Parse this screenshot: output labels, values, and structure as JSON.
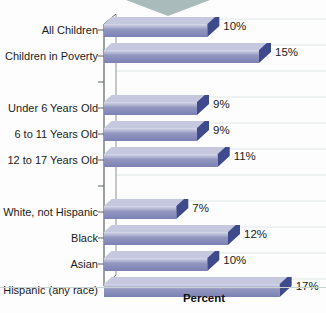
{
  "chart_data": {
    "type": "bar",
    "orientation": "horizontal",
    "title": "",
    "subtitle": "",
    "xlabel": "Percent",
    "ylabel": "",
    "xlim": [
      0,
      18
    ],
    "grid": true,
    "legend": "none",
    "value_suffix": "%",
    "categories": [
      "All Children",
      "Children in Poverty",
      "Under 6 Years Old",
      "6 to 11 Years Old",
      "12 to 17 Years Old",
      "White, not Hispanic",
      "Black",
      "Asian",
      "Hispanic (any race)"
    ],
    "values": [
      10,
      15,
      9,
      9,
      11,
      7,
      12,
      10,
      17
    ],
    "value_labels": [
      "10%",
      "15%",
      "9%",
      "9%",
      "11%",
      "7%",
      "12%",
      "10%",
      "17%"
    ],
    "rows": [
      {
        "label": "All Children",
        "value": 10,
        "value_label": "10%",
        "gap_after": false
      },
      {
        "label": "Children in Poverty",
        "value": 15,
        "value_label": "15%",
        "gap_after": true
      },
      {
        "label": "Under 6 Years Old",
        "value": 9,
        "value_label": "9%",
        "gap_after": false
      },
      {
        "label": "6 to 11 Years Old",
        "value": 9,
        "value_label": "9%",
        "gap_after": false
      },
      {
        "label": "12 to 17 Years Old",
        "value": 11,
        "value_label": "11%",
        "gap_after": true
      },
      {
        "label": "White, not Hispanic",
        "value": 7,
        "value_label": "7%",
        "gap_after": false
      },
      {
        "label": "Black",
        "value": 12,
        "value_label": "12%",
        "gap_after": false
      },
      {
        "label": "Asian",
        "value": 10,
        "value_label": "10%",
        "gap_after": false
      },
      {
        "label": "Hispanic (any race)",
        "value": 17,
        "value_label": "17%",
        "gap_after": false
      }
    ]
  },
  "style": {
    "bar_face_light": "#d8daea",
    "bar_face_mid": "#9296bf",
    "bar_face_dark": "#7b81b4",
    "bar_top_face": "#c5c8de",
    "bar_end_cap": "#3f4a8c",
    "gridline_color": "#dfe6e6",
    "axis_color": "#5c6262",
    "background": "#fdfdfd",
    "chevron_color": "#a9bcbb",
    "text_color": "#1b1b1b"
  },
  "decoration": {
    "top_chevron": "chevron-down-shape"
  }
}
